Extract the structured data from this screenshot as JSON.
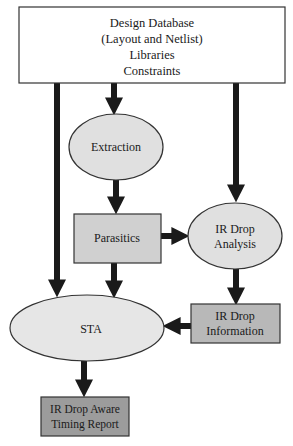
{
  "diagram": {
    "colors": {
      "arrow": "#1a1a1a",
      "stroke": "#333333",
      "ellipse_fill": "#e0e0e0",
      "box_light_fill": "#d0d0d0",
      "box_mid_fill": "#b8b8b8",
      "box_dark_fill": "#9c9c9c"
    },
    "nodes": {
      "design_database": {
        "lines": [
          "Design Database",
          "(Layout and Netlist)",
          "Libraries",
          "Constraints"
        ]
      },
      "extraction": {
        "lines": [
          "Extraction"
        ]
      },
      "parasitics": {
        "lines": [
          "Parasitics"
        ]
      },
      "ir_drop_analysis": {
        "lines": [
          "IR Drop",
          "Analysis"
        ]
      },
      "sta": {
        "lines": [
          "STA"
        ]
      },
      "ir_drop_information": {
        "lines": [
          "IR Drop",
          "Information"
        ]
      },
      "ir_drop_aware_timing_report": {
        "lines": [
          "IR Drop Aware",
          "Timing Report"
        ]
      }
    },
    "edges": [
      {
        "from": "design_database",
        "to": "sta"
      },
      {
        "from": "design_database",
        "to": "extraction"
      },
      {
        "from": "design_database",
        "to": "ir_drop_analysis"
      },
      {
        "from": "extraction",
        "to": "parasitics"
      },
      {
        "from": "parasitics",
        "to": "ir_drop_analysis"
      },
      {
        "from": "parasitics",
        "to": "sta"
      },
      {
        "from": "ir_drop_analysis",
        "to": "ir_drop_information"
      },
      {
        "from": "ir_drop_information",
        "to": "sta"
      },
      {
        "from": "sta",
        "to": "ir_drop_aware_timing_report"
      }
    ]
  }
}
